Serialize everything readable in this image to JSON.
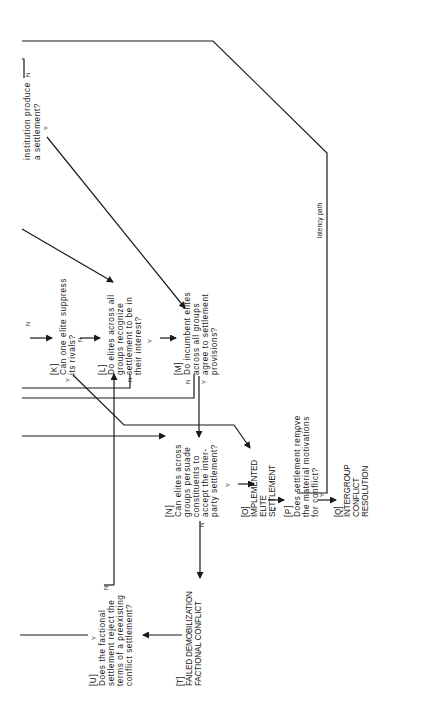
{
  "diagram": {
    "orientation": "rotated-90-ccw",
    "nodes": {
      "top": {
        "lines": [
          "institution produce",
          "a settlement?"
        ],
        "yes": "Y",
        "no": "N"
      },
      "K": {
        "id": "[K]",
        "lines": [
          "Can one elite suppress",
          "its   rivals?"
        ],
        "yes": "Y",
        "no": "N",
        "in": "N"
      },
      "L": {
        "id": "[L]",
        "lines": [
          "Do elites across all",
          "groups recognize",
          "settlement to be in",
          "their  interest?"
        ],
        "yes": "Y",
        "no": "N"
      },
      "M": {
        "id": "[M]",
        "lines": [
          "Do incumbent elites",
          "across all groups",
          "agree to settlement",
          "provisions?"
        ],
        "yes": "Y",
        "no": "N"
      },
      "N": {
        "id": "[N]",
        "lines": [
          "Can elites across",
          "groups persuade",
          "constituents to",
          "accept the inter-",
          "party settlement?"
        ],
        "yes": "Y",
        "no": "N"
      },
      "O": {
        "id": "[O]",
        "lines": [
          "IMPLEMENTED",
          "ELITE",
          "SETTLEMENT"
        ]
      },
      "P": {
        "id": "[P]",
        "lines": [
          "Does settlement remove",
          "the material motivations",
          "for   conflict?"
        ],
        "yes": "Y",
        "no": "N"
      },
      "Q": {
        "id": "[Q]",
        "lines": [
          "INTERGROUP",
          "CONFLICT",
          "RESOLUTION"
        ]
      },
      "T": {
        "id": "[T]",
        "lines": [
          "FAILED DEMOBILIZATION",
          "FACTIONAL CONFLICT"
        ]
      },
      "U": {
        "id": "[U]",
        "lines": [
          "Does the factional",
          "settlement reject the",
          "terms of a preexisting",
          "conflict settlement?"
        ],
        "yes": "Y",
        "no": "N"
      }
    },
    "edge_labels": {
      "latency": "latency path"
    }
  }
}
